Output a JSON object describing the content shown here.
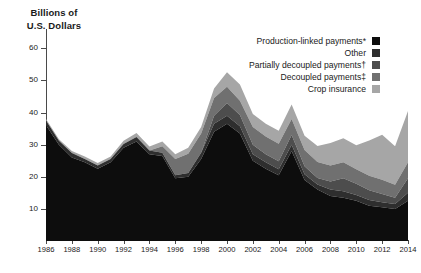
{
  "chart_data": {
    "type": "area",
    "stacked": true,
    "title": "",
    "subtitle": "",
    "ylabel": "Billions of U.S. Dollars",
    "ylabel_lines": [
      "Billions of",
      "U.S. Dollars"
    ],
    "xlabel": "",
    "ylim": [
      0,
      66
    ],
    "yticks": [
      10,
      20,
      30,
      40,
      50,
      60
    ],
    "xlim": [
      1986,
      2014
    ],
    "grid": false,
    "legend_position": "top-right",
    "x": [
      1986,
      1987,
      1988,
      1989,
      1990,
      1991,
      1992,
      1993,
      1994,
      1995,
      1996,
      1997,
      1998,
      1999,
      2000,
      2001,
      2002,
      2003,
      2004,
      2005,
      2006,
      2007,
      2008,
      2009,
      2010,
      2011,
      2012,
      2013,
      2014
    ],
    "categories": [
      "1986",
      "1987",
      "1988",
      "1989",
      "1990",
      "1991",
      "1992",
      "1993",
      "1994",
      "1995",
      "1996",
      "1997",
      "1998",
      "1999",
      "2000",
      "2001",
      "2002",
      "2003",
      "2004",
      "2005",
      "2006",
      "2007",
      "2008",
      "2009",
      "2010",
      "2011",
      "2012",
      "2013",
      "2014"
    ],
    "xticks": [
      1986,
      1988,
      1990,
      1992,
      1994,
      1996,
      1998,
      2000,
      2002,
      2004,
      2006,
      2008,
      2010,
      2012,
      2014
    ],
    "xtick_labels": [
      "1986",
      "1988",
      "1990",
      "1992",
      "1994",
      "1996",
      "1998",
      "2000",
      "2002",
      "2004",
      "2006",
      "2008",
      "2010",
      "2012",
      "2014"
    ],
    "series": [
      {
        "name": "Production-linked payments*",
        "color": "#0d0d0d",
        "values": [
          36.0,
          30.0,
          26.0,
          24.5,
          22.5,
          24.5,
          29.0,
          31.0,
          27.0,
          26.5,
          19.5,
          20.0,
          25.5,
          34.0,
          36.5,
          33.5,
          25.0,
          22.5,
          20.5,
          28.0,
          19.0,
          16.0,
          14.0,
          13.5,
          12.5,
          11.0,
          10.5,
          10.0,
          12.5
        ]
      },
      {
        "name": "Other",
        "color": "#2e2e2e",
        "values": [
          1.5,
          1.2,
          1.4,
          1.0,
          1.0,
          1.0,
          1.2,
          1.4,
          1.2,
          1.0,
          1.0,
          1.2,
          2.0,
          2.5,
          2.5,
          2.2,
          2.0,
          2.0,
          1.8,
          2.0,
          1.8,
          1.6,
          2.0,
          2.0,
          1.8,
          1.8,
          1.6,
          1.5,
          2.5
        ]
      },
      {
        "name": "Partially decoupled payments†",
        "color": "#4d4d4d",
        "values": [
          0.0,
          0.0,
          0.0,
          0.0,
          0.0,
          0.0,
          0.0,
          0.0,
          0.0,
          0.0,
          0.0,
          0.0,
          0.0,
          2.5,
          4.0,
          3.5,
          3.0,
          2.5,
          2.5,
          3.0,
          2.5,
          2.0,
          2.5,
          4.0,
          3.5,
          3.0,
          2.5,
          2.0,
          4.5
        ]
      },
      {
        "name": "Decoupled payments‡",
        "color": "#707070",
        "values": [
          0.0,
          0.0,
          0.0,
          0.0,
          0.0,
          0.0,
          0.0,
          0.0,
          0.0,
          2.0,
          5.0,
          6.0,
          6.0,
          5.5,
          5.0,
          4.5,
          5.5,
          5.5,
          5.5,
          5.0,
          5.0,
          5.0,
          5.0,
          5.0,
          4.5,
          4.5,
          4.5,
          4.0,
          5.0
        ]
      },
      {
        "name": "Crop insurance",
        "color": "#a6a6a6",
        "values": [
          0.5,
          0.5,
          0.6,
          0.8,
          0.8,
          0.8,
          1.0,
          1.2,
          1.2,
          1.5,
          1.5,
          1.8,
          2.0,
          3.0,
          4.5,
          5.0,
          4.0,
          4.0,
          4.0,
          4.5,
          4.5,
          5.0,
          7.0,
          7.5,
          7.5,
          11.0,
          14.0,
          12.0,
          16.0
        ]
      }
    ],
    "totals": [
      38.0,
      31.7,
      28.0,
      26.3,
      24.3,
      26.3,
      31.2,
      33.6,
      29.4,
      31.0,
      27.0,
      29.0,
      35.5,
      47.5,
      52.5,
      48.7,
      39.5,
      36.5,
      34.3,
      42.5,
      32.8,
      29.6,
      30.5,
      32.0,
      29.8,
      31.3,
      33.1,
      29.5,
      40.5
    ]
  },
  "legend": {
    "items": [
      {
        "label": "Production-linked payments*",
        "color": "#0d0d0d"
      },
      {
        "label": "Other",
        "color": "#2e2e2e"
      },
      {
        "label": "Partially decoupled payments†",
        "color": "#4d4d4d"
      },
      {
        "label": "Decoupled payments‡",
        "color": "#707070"
      },
      {
        "label": "Crop insurance",
        "color": "#a6a6a6"
      }
    ]
  }
}
